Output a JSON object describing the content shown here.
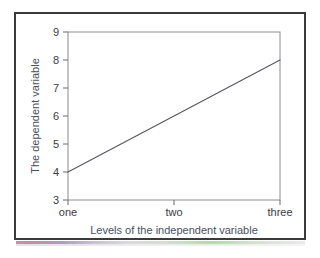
{
  "figure": {
    "background_color": "#ffffff",
    "frame_color": "#3a3a3c"
  },
  "chart_data": {
    "type": "line",
    "title": "",
    "subtitle": "",
    "xlabel": "Levels of the independent variable",
    "ylabel": "The dependent variable",
    "categories": [
      "one",
      "two",
      "three"
    ],
    "series": [
      {
        "name": "",
        "values": [
          4,
          6,
          8
        ]
      }
    ],
    "x": [
      1,
      2,
      3
    ],
    "xtick_labels": [
      "one",
      "two",
      "three"
    ],
    "ytick_labels": [
      "3",
      "4",
      "5",
      "6",
      "7",
      "8",
      "9"
    ],
    "ytick_values": [
      3,
      4,
      5,
      6,
      7,
      8,
      9
    ],
    "ylim": [
      3,
      9
    ],
    "xlim": [
      1,
      3
    ],
    "grid": false,
    "legend": false,
    "legend_position": "none",
    "line_color": "#55555c",
    "line_width": 1,
    "markers": false,
    "annotations": []
  }
}
